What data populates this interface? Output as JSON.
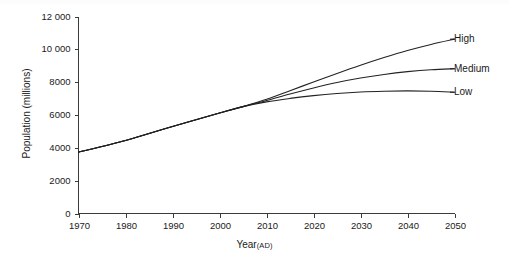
{
  "chart_data": {
    "type": "line",
    "title": "",
    "xlabel": "Year",
    "xlabel_unit": "(AD)",
    "ylabel": "Population (millions)",
    "xlim": [
      1970,
      2050
    ],
    "ylim": [
      0,
      12000
    ],
    "grid": false,
    "legend_position": "right-end-labels",
    "xticks": [
      1970,
      1980,
      1990,
      2000,
      2010,
      2020,
      2030,
      2040,
      2050
    ],
    "xtick_labels": [
      "1970",
      "1980",
      "1990",
      "2000",
      "2010",
      "2020",
      "2030",
      "2040",
      "2050"
    ],
    "yticks": [
      0,
      2000,
      4000,
      6000,
      8000,
      10000,
      12000
    ],
    "ytick_labels": [
      "0",
      "2000",
      "4000",
      "6000",
      "8000",
      "10 000",
      "12 000"
    ],
    "x": [
      1970,
      1980,
      1990,
      2000,
      2005,
      2010,
      2015,
      2020,
      2025,
      2030,
      2035,
      2040,
      2045,
      2050
    ],
    "series": [
      {
        "name": "High",
        "label": "High",
        "values": [
          3740,
          4450,
          5300,
          6120,
          6510,
          6960,
          7480,
          8010,
          8530,
          9030,
          9500,
          9930,
          10300,
          10620
        ]
      },
      {
        "name": "Medium",
        "label": "Medium",
        "values": [
          3740,
          4450,
          5300,
          6120,
          6510,
          6880,
          7280,
          7650,
          7980,
          8250,
          8470,
          8640,
          8760,
          8820
        ]
      },
      {
        "name": "Low",
        "label": "Low",
        "values": [
          3740,
          4450,
          5300,
          6120,
          6510,
          6800,
          7010,
          7180,
          7310,
          7400,
          7450,
          7470,
          7450,
          7390
        ]
      }
    ]
  }
}
